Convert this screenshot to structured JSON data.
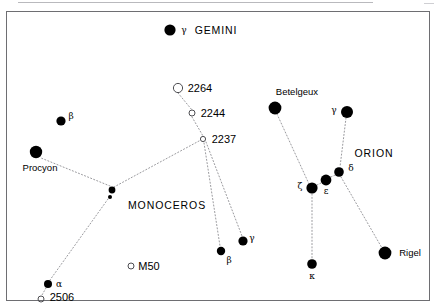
{
  "chart": {
    "type": "sky-map",
    "width": 438,
    "height": 308,
    "background_color": "#ffffff",
    "ink_color": "#000000",
    "line_color": "#9a9a9e",
    "frame_color": "#6e6e72"
  },
  "constellation_labels": [
    {
      "id": "gemini",
      "text": "GEMINI",
      "x": 216,
      "y": 30
    },
    {
      "id": "monoceros",
      "text": "MONOCEROS",
      "x": 167,
      "y": 205
    },
    {
      "id": "orion",
      "text": "ORION",
      "x": 374,
      "y": 153
    }
  ],
  "stars": [
    {
      "id": "gamma-gem",
      "greek": "γ",
      "name": "",
      "x": 170,
      "y": 30,
      "r": 5.6,
      "greek_x": 184,
      "greek_y": 30
    },
    {
      "id": "beta-cmi",
      "greek": "β",
      "name": "",
      "x": 61,
      "y": 121,
      "r": 4.6,
      "greek_x": 71,
      "greek_y": 116
    },
    {
      "id": "procyon",
      "greek": "",
      "name": "Procyon",
      "x": 36,
      "y": 152,
      "r": 6.2,
      "name_x": 40,
      "name_y": 168
    },
    {
      "id": "mon-chain-a",
      "greek": "",
      "name": "",
      "x": 112,
      "y": 190,
      "r": 3.4
    },
    {
      "id": "mon-chain-b",
      "greek": "",
      "name": "",
      "x": 110,
      "y": 197,
      "r": 2.0
    },
    {
      "id": "alpha-mon",
      "greek": "α",
      "name": "",
      "x": 48,
      "y": 284,
      "r": 4.0,
      "greek_x": 59,
      "greek_y": 284
    },
    {
      "id": "beta-mon",
      "greek": "β",
      "name": "",
      "x": 221,
      "y": 251,
      "r": 4.2,
      "greek_x": 229,
      "greek_y": 260
    },
    {
      "id": "gamma-mon",
      "greek": "γ",
      "name": "",
      "x": 243,
      "y": 241,
      "r": 4.6,
      "greek_x": 252,
      "greek_y": 238
    },
    {
      "id": "betelgeux",
      "greek": "",
      "name": "Betelgeux",
      "x": 275,
      "y": 108,
      "r": 6.4,
      "name_x": 297,
      "name_y": 92
    },
    {
      "id": "gamma-ori",
      "greek": "γ",
      "name": "",
      "x": 347,
      "y": 112,
      "r": 6.0,
      "greek_x": 334,
      "greek_y": 110
    },
    {
      "id": "delta-ori",
      "greek": "δ",
      "name": "",
      "x": 339,
      "y": 172,
      "r": 4.8,
      "greek_x": 351,
      "greek_y": 168
    },
    {
      "id": "epsilon-ori",
      "greek": "ε",
      "name": "",
      "x": 326,
      "y": 180,
      "r": 5.4,
      "greek_x": 326,
      "greek_y": 191
    },
    {
      "id": "zeta-ori",
      "greek": "ζ",
      "name": "",
      "x": 312,
      "y": 188,
      "r": 5.6,
      "greek_x": 300,
      "greek_y": 186
    },
    {
      "id": "kappa-ori",
      "greek": "κ",
      "name": "",
      "x": 312,
      "y": 264,
      "r": 4.8,
      "greek_x": 312,
      "greek_y": 276
    },
    {
      "id": "rigel",
      "greek": "",
      "name": "Rigel",
      "x": 385,
      "y": 253,
      "r": 6.4,
      "name_x": 410,
      "name_y": 253
    }
  ],
  "clusters": [
    {
      "id": "ngc2264",
      "label": "2264",
      "x": 178,
      "y": 88,
      "r": 4.6,
      "label_x": 200,
      "label_y": 88
    },
    {
      "id": "ngc2244",
      "label": "2244",
      "x": 192,
      "y": 113,
      "r": 3.0,
      "label_x": 213,
      "label_y": 113
    },
    {
      "id": "ngc2237",
      "label": "2237",
      "x": 203,
      "y": 139,
      "r": 2.6,
      "label_x": 224,
      "label_y": 139
    },
    {
      "id": "m50",
      "label": "M50",
      "x": 131,
      "y": 266,
      "r": 3.0,
      "label_x": 149,
      "label_y": 266
    },
    {
      "id": "ngc2506",
      "label": "2506",
      "x": 41,
      "y": 299,
      "r": 3.0,
      "label_x": 62,
      "label_y": 297
    }
  ],
  "lines": [
    {
      "id": "line-2264-2244",
      "x1": 178,
      "y1": 93,
      "x2": 192,
      "y2": 110
    },
    {
      "id": "line-2244-2237",
      "x1": 192,
      "y1": 117,
      "x2": 203,
      "y2": 136
    },
    {
      "id": "line-2237-beta-mon",
      "x1": 204,
      "y1": 143,
      "x2": 220,
      "y2": 246
    },
    {
      "id": "line-2237-gamma-mon",
      "x1": 206,
      "y1": 142,
      "x2": 242,
      "y2": 236
    },
    {
      "id": "line-2237-monchain",
      "x1": 199,
      "y1": 141,
      "x2": 114,
      "y2": 187
    },
    {
      "id": "line-monchain-procyon",
      "x1": 110,
      "y1": 186,
      "x2": 41,
      "y2": 158
    },
    {
      "id": "line-monchain-alpha",
      "x1": 108,
      "y1": 199,
      "x2": 50,
      "y2": 280
    },
    {
      "id": "line-betelgeux-zeta",
      "x1": 277,
      "y1": 114,
      "x2": 309,
      "y2": 184
    },
    {
      "id": "line-gammaori-delta",
      "x1": 346,
      "y1": 118,
      "x2": 340,
      "y2": 167
    },
    {
      "id": "line-zeta-epsilon",
      "x1": 317,
      "y1": 185,
      "x2": 321,
      "y2": 183
    },
    {
      "id": "line-epsilon-delta",
      "x1": 331,
      "y1": 177,
      "x2": 335,
      "y2": 175
    },
    {
      "id": "line-zeta-kappa",
      "x1": 312,
      "y1": 194,
      "x2": 312,
      "y2": 259
    },
    {
      "id": "line-delta-rigel",
      "x1": 341,
      "y1": 177,
      "x2": 382,
      "y2": 248
    },
    {
      "id": "line-alpha-2506",
      "x1": 46,
      "y1": 288,
      "x2": 42,
      "y2": 295
    }
  ]
}
